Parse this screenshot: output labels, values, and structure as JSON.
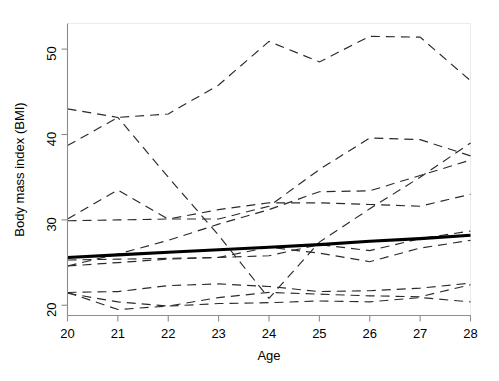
{
  "chart_data": {
    "type": "line",
    "title": "",
    "subtitle": "",
    "xlabel": "Age",
    "ylabel": "Body mass index (BMI)",
    "x": [
      20,
      21,
      22,
      23,
      24,
      25,
      26,
      27,
      28
    ],
    "xticks": [
      20,
      21,
      22,
      23,
      24,
      25,
      26,
      27,
      28
    ],
    "xticklabels": [
      "20",
      "21",
      "22",
      "23",
      "24",
      "25",
      "26",
      "27",
      "28"
    ],
    "yticks": [
      20,
      30,
      40,
      50
    ],
    "yticklabels": [
      "20",
      "30",
      "40",
      "50"
    ],
    "xlim": [
      20,
      28
    ],
    "ylim": [
      18.8,
      53.0
    ],
    "grid": false,
    "legend": null,
    "legend_position": "none",
    "annotations": [],
    "series": [
      {
        "name": "subject-1",
        "style": "dashed",
        "values": [
          38.7,
          42.0,
          42.4,
          45.8,
          50.9,
          48.5,
          51.5,
          51.4,
          46.3
        ]
      },
      {
        "name": "subject-2",
        "style": "dashed",
        "values": [
          30.1,
          33.5,
          30.1,
          30.1,
          31.6,
          35.9,
          39.6,
          39.4,
          37.5
        ]
      },
      {
        "name": "subject-3",
        "style": "dashed",
        "values": [
          29.9,
          30.0,
          30.1,
          31.2,
          32.0,
          32.0,
          31.8,
          31.6,
          33.0
        ]
      },
      {
        "name": "subject-4",
        "style": "dashed",
        "values": [
          24.6,
          26.0,
          27.6,
          29.5,
          31.2,
          33.3,
          33.4,
          35.2,
          37.0
        ]
      },
      {
        "name": "subject-5",
        "style": "dashed",
        "values": [
          43.0,
          42.0,
          35.0,
          28.2,
          20.8,
          27.4,
          31.3,
          35.0,
          39.0
        ]
      },
      {
        "name": "subject-6",
        "style": "dashed",
        "values": [
          25.3,
          25.4,
          25.5,
          25.6,
          25.8,
          27.1,
          26.4,
          27.8,
          28.7
        ]
      },
      {
        "name": "subject-7",
        "style": "dashed",
        "values": [
          24.6,
          25.0,
          25.4,
          25.6,
          26.8,
          26.1,
          25.1,
          26.7,
          27.6
        ]
      },
      {
        "name": "subject-8",
        "style": "dashed",
        "values": [
          21.5,
          21.6,
          22.3,
          22.5,
          22.2,
          21.6,
          21.7,
          22.0,
          22.6
        ]
      },
      {
        "name": "subject-9",
        "style": "dashed",
        "values": [
          21.4,
          20.4,
          19.9,
          20.9,
          21.5,
          21.3,
          21.1,
          21.0,
          22.4
        ]
      },
      {
        "name": "subject-10",
        "style": "dashed",
        "values": [
          21.5,
          19.5,
          19.9,
          20.2,
          20.3,
          20.5,
          20.4,
          20.9,
          20.4
        ]
      }
    ],
    "fit_line": {
      "name": "population-mean-fit",
      "style": "solid-thick",
      "values": [
        25.6,
        25.9,
        26.2,
        26.5,
        26.8,
        27.1,
        27.5,
        27.8,
        28.2
      ]
    }
  }
}
